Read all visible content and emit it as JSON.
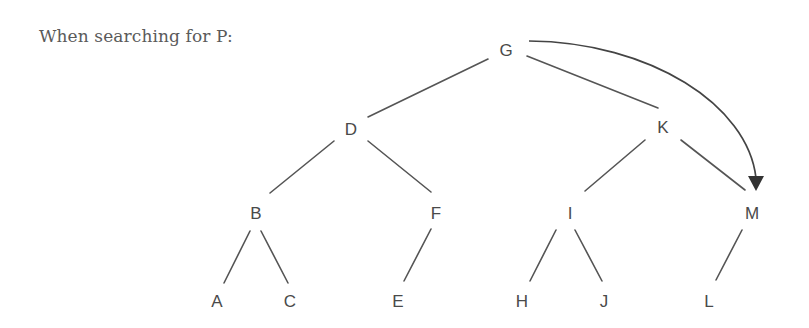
{
  "caption": "When searching for P:",
  "tree": {
    "nodes": {
      "G": {
        "label": "G",
        "x": 506,
        "y": 50
      },
      "D": {
        "label": "D",
        "x": 351,
        "y": 129
      },
      "K": {
        "label": "K",
        "x": 663,
        "y": 127
      },
      "B": {
        "label": "B",
        "x": 256,
        "y": 213
      },
      "F": {
        "label": "F",
        "x": 436,
        "y": 213
      },
      "I": {
        "label": "I",
        "x": 570,
        "y": 213
      },
      "M": {
        "label": "M",
        "x": 752,
        "y": 213
      },
      "A": {
        "label": "A",
        "x": 217,
        "y": 301
      },
      "C": {
        "label": "C",
        "x": 290,
        "y": 301
      },
      "E": {
        "label": "E",
        "x": 398,
        "y": 301
      },
      "H": {
        "label": "H",
        "x": 522,
        "y": 301
      },
      "J": {
        "label": "J",
        "x": 604,
        "y": 301
      },
      "L": {
        "label": "L",
        "x": 709,
        "y": 301
      }
    },
    "edges": [
      [
        "G",
        "D"
      ],
      [
        "G",
        "K"
      ],
      [
        "D",
        "B"
      ],
      [
        "D",
        "F"
      ],
      [
        "K",
        "I"
      ],
      [
        "K",
        "M"
      ],
      [
        "B",
        "A"
      ],
      [
        "B",
        "C"
      ],
      [
        "F",
        "E"
      ],
      [
        "I",
        "H"
      ],
      [
        "I",
        "J"
      ],
      [
        "M",
        "L"
      ]
    ],
    "search_arrow": {
      "from": "G",
      "to": "M",
      "color": "#333333"
    }
  }
}
